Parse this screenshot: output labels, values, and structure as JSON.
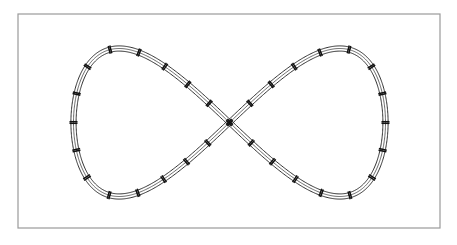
{
  "document": {
    "title": "Figure-Eight Model Railway Track Layout",
    "background_color": "#ffffff",
    "width": 457,
    "height": 245
  },
  "border": {
    "name": "page-border",
    "x": 18,
    "y": 14,
    "width": 422,
    "height": 214,
    "stroke_color": "#9a9a9a",
    "stroke_width": 1.2,
    "fill": "none"
  },
  "track": {
    "name": "figure-eight-track-layout",
    "shape": "lemniscate",
    "rail_color": "#1c1c1c",
    "rail_stroke_width": 0.9,
    "center_line_color": "#2a2a2a",
    "center_line_stroke_width": 0.7,
    "joint_bar_color": "#111111",
    "joint_bar_stroke_width": 1.5,
    "gauge_width": 5.2,
    "joint_bar_length": 8.0,
    "joint_bar_pair_offset": 1.6,
    "left_loop": {
      "name": "left-loop",
      "center_x": 145,
      "center_y": 122,
      "radius_x": 66,
      "radius_y": 66
    },
    "right_loop": {
      "name": "right-loop",
      "center_x": 314,
      "center_y": 122,
      "radius_x": 66,
      "radius_y": 66
    },
    "crossing": {
      "name": "track-crossing",
      "center_x": 229,
      "center_y": 123,
      "angle_degrees": 38
    },
    "segment_count": 32,
    "extents": {
      "left": 74,
      "right": 386,
      "top": 53,
      "bottom": 192
    }
  },
  "chart_data": {
    "type": "line",
    "xlabel": "",
    "ylabel": "",
    "xlim": [
      18,
      440
    ],
    "ylim": [
      14,
      228
    ],
    "grid": false,
    "legend": "none",
    "annotations": [],
    "series": [
      {
        "name": "track-centerline-lemniscate",
        "parametric": "Gerono lemniscate",
        "description": "x = cx + a*sin(t), y = cy + b*sin(t)*cos(t)",
        "cx": 229.5,
        "cy": 122.5,
        "a": 156,
        "b": 148,
        "samples": 720
      }
    ]
  }
}
